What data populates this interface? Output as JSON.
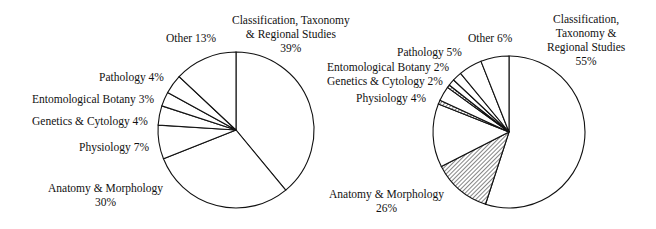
{
  "chart_data": [
    {
      "type": "pie",
      "title": "",
      "categories": [
        "Classification, Taxonomy & Regional Studies",
        "Anatomy & Morphology",
        "Physiology",
        "Genetics & Cytology",
        "Entomological Botany",
        "Pathology",
        "Other"
      ],
      "values": [
        39,
        30,
        7,
        4,
        3,
        4,
        13
      ],
      "labels": {
        "classification": [
          "Classification, Taxonomy",
          "& Regional Studies",
          "39%"
        ],
        "anatomy": [
          "Anatomy & Morphology",
          "30%"
        ],
        "physiology": "Physiology  7%",
        "genetics": "Genetics & Cytology  4%",
        "entomological": "Entomological Botany  3%",
        "pathology": "Pathology  4%",
        "other": "Other  13%"
      }
    },
    {
      "type": "pie",
      "title": "",
      "categories": [
        "Classification, Taxonomy & Regional Studies",
        "Anatomy & Morphology",
        "Physiology",
        "Genetics & Cytology",
        "Entomological Botany",
        "Pathology",
        "Other"
      ],
      "values": [
        55,
        26,
        4,
        2,
        2,
        5,
        6
      ],
      "labels": {
        "classification": [
          "Classification,",
          "Taxonomy &",
          "Regional Studies",
          "55%"
        ],
        "anatomy": [
          "Anatomy & Morphology",
          "26%"
        ],
        "physiology": "Physiology  4%",
        "genetics": "Genetics & Cytology  2%",
        "entomological": "Entomological Botany  2%",
        "pathology": "Pathology  5%",
        "other": "Other  6%"
      }
    }
  ]
}
